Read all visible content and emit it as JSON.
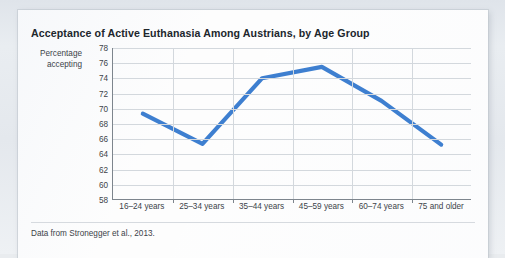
{
  "card": {
    "title": "Acceptance of Active Euthanasia Among Austrians, by Age Group",
    "source_note": "Data from Stronegger et al., 2013.",
    "line_color": "#3E7FD0",
    "axis_color": "#7d858d",
    "grid_color": "#d3d8dd"
  },
  "chart_data": {
    "type": "line",
    "title": "Acceptance of Active Euthanasia Among Austrians, by Age Group",
    "xlabel": "",
    "ylabel": "Percentage accepting",
    "ylabel_lines": [
      "Percentage",
      "accepting"
    ],
    "categories": [
      "16–24 years",
      "25–34 years",
      "35–44 years",
      "45–59 years",
      "60–74 years",
      "75 and older"
    ],
    "values": [
      69.3,
      65.3,
      74.0,
      75.5,
      71.0,
      65.2
    ],
    "ylim": [
      58,
      78
    ],
    "yticks": [
      78,
      76,
      74,
      72,
      70,
      68,
      66,
      64,
      62,
      60,
      58
    ],
    "grid": true,
    "legend": "none",
    "series": [
      {
        "name": "Percentage accepting",
        "color": "#3E7FD0",
        "values": [
          69.3,
          65.3,
          74.0,
          75.5,
          71.0,
          65.2
        ]
      }
    ],
    "source": "Data from Stronegger et al., 2013."
  }
}
